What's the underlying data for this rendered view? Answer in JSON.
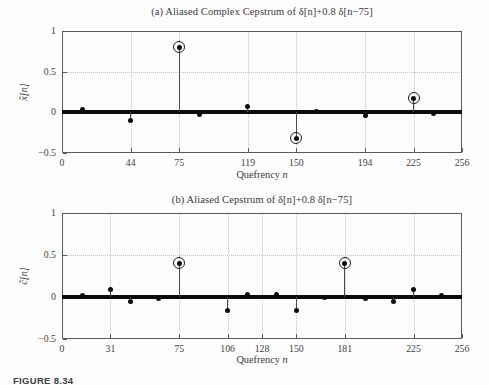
{
  "figure": {
    "caption": "FIGURE 8.34"
  },
  "chart_data": [
    {
      "type": "stem",
      "title": "(a) Aliased Complex Cepstrum of δ[n]+0.8 δ[n−75]",
      "xlabel": "Quefrency n",
      "ylabel": "x̃[n]",
      "xlim": [
        0,
        256
      ],
      "ylim": [
        -0.5,
        1
      ],
      "xticks": [
        0,
        44,
        75,
        119,
        150,
        194,
        225,
        256
      ],
      "yticks": [
        -0.5,
        0,
        0.5,
        1
      ],
      "grid": true,
      "zero_line_thick": true,
      "highlight_marker": "circle",
      "points": [
        {
          "n": 13,
          "v": 0.03
        },
        {
          "n": 44,
          "v": -0.102
        },
        {
          "n": 75,
          "v": 0.8,
          "circled": true
        },
        {
          "n": 88,
          "v": -0.021
        },
        {
          "n": 119,
          "v": 0.066
        },
        {
          "n": 150,
          "v": -0.32,
          "circled": true
        },
        {
          "n": 163,
          "v": 0.015
        },
        {
          "n": 194,
          "v": -0.044
        },
        {
          "n": 225,
          "v": 0.171,
          "circled": true
        },
        {
          "n": 238,
          "v": -0.011
        }
      ]
    },
    {
      "type": "stem",
      "title": "(b) Aliased Cepstrum of δ[n]+0.8 δ[n−75]",
      "xlabel": "Quefrency n",
      "ylabel": "c̃[n]",
      "xlim": [
        0,
        256
      ],
      "ylim": [
        -0.5,
        1
      ],
      "xticks": [
        0,
        31,
        75,
        106,
        128,
        150,
        181,
        225,
        256
      ],
      "yticks": [
        -0.5,
        0,
        0.5,
        1
      ],
      "grid": true,
      "zero_line_thick": true,
      "highlight_marker": "circle",
      "points": [
        {
          "n": 13,
          "v": 0.015
        },
        {
          "n": 31,
          "v": 0.085
        },
        {
          "n": 44,
          "v": -0.051
        },
        {
          "n": 62,
          "v": -0.022
        },
        {
          "n": 75,
          "v": 0.4,
          "circled": true
        },
        {
          "n": 106,
          "v": -0.16
        },
        {
          "n": 119,
          "v": 0.033
        },
        {
          "n": 137,
          "v": 0.033
        },
        {
          "n": 150,
          "v": -0.16
        },
        {
          "n": 168,
          "v": -0.01
        },
        {
          "n": 181,
          "v": 0.4,
          "circled": true
        },
        {
          "n": 194,
          "v": -0.022
        },
        {
          "n": 212,
          "v": -0.051
        },
        {
          "n": 225,
          "v": 0.085
        },
        {
          "n": 243,
          "v": 0.015
        }
      ]
    }
  ]
}
